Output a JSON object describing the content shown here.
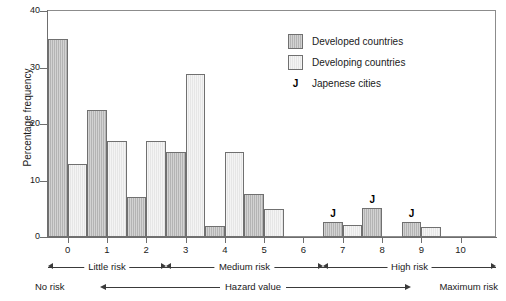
{
  "chart_data": {
    "type": "bar",
    "title": "",
    "subtitle": "",
    "xlabel": "Hazard value",
    "ylabel": "Percentage frequency",
    "categories": [
      "0",
      "1",
      "2",
      "3",
      "4",
      "5",
      "6",
      "7",
      "8",
      "9",
      "10"
    ],
    "xlim": [
      -0.5,
      10.9
    ],
    "ylim": [
      0,
      40
    ],
    "yticks": [
      0,
      10,
      20,
      30,
      40
    ],
    "grid": false,
    "legend_position": "upper-right",
    "series": [
      {
        "name": "Developed countries",
        "color": "#b4b4b4",
        "values": [
          35.0,
          22.5,
          7.0,
          15.0,
          2.0,
          7.7,
          0,
          2.6,
          5.2,
          2.6,
          0
        ]
      },
      {
        "name": "Developing countries",
        "color": "#e6e6e6",
        "values": [
          13.0,
          17.0,
          17.0,
          28.8,
          15.0,
          5.0,
          0,
          2.1,
          0,
          1.7,
          0
        ]
      }
    ],
    "annotations": [
      {
        "label": "J",
        "category": "7",
        "note": "Japanese cities"
      },
      {
        "label": "J",
        "category": "8",
        "note": "Japanese cities"
      },
      {
        "label": "J",
        "category": "9",
        "note": "Japanese cities"
      }
    ]
  },
  "axes": {
    "y": {
      "label": "Percentage frequency",
      "ticks": [
        "0",
        "10",
        "20",
        "30",
        "40"
      ]
    },
    "x": {
      "ticks": [
        "0",
        "1",
        "2",
        "3",
        "4",
        "5",
        "6",
        "7",
        "8",
        "9",
        "10"
      ]
    }
  },
  "legend": {
    "items": [
      {
        "label": "Developed countries",
        "swatch": "developed"
      },
      {
        "label": "Developing countries",
        "swatch": "developing"
      },
      {
        "label": "Japenese cities",
        "swatch": "j-marker",
        "marker": "J"
      }
    ]
  },
  "ranges": {
    "little": "Little risk",
    "medium": "Medium risk",
    "high": "High risk"
  },
  "hazard_axis": {
    "left": "No risk",
    "center": "Hazard value",
    "right": "Maximum risk"
  }
}
